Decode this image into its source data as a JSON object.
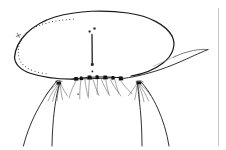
{
  "figure": {
    "title": "",
    "caption": "",
    "background_color": "#ffffff",
    "ink_color": "#1a1a1a",
    "width": 226,
    "height": 150,
    "style": "scientific line drawing, pen and ink"
  },
  "parts": {
    "body_outline": {
      "name": "body-outline",
      "description": "large oval dorsal shield outline"
    },
    "stipple_margin": {
      "name": "stippled-inner-margin",
      "description": "dotted inner line following the left and upper-left body margin",
      "dot_count": 34
    },
    "notch_mark": {
      "name": "lateral-notch-mark",
      "description": "small angular notch on upper-left margin"
    },
    "median_seta": {
      "name": "median-vertical-seta",
      "description": "vertical line on midline with a basal mark",
      "top_dots": 2
    },
    "ventral_tubercle_row": {
      "name": "ventral-setal-tubercle-row",
      "description": "row of dark setal bases along the lower body margin",
      "tubercle_count": 7
    },
    "ventral_setae": {
      "name": "ventral-setae-fan",
      "description": "fine curved setae descending from the tubercle row",
      "seta_count": 11
    },
    "lateral_appendage": {
      "name": "lateral-appendage",
      "description": "tapering appendage extending to the right and crossing the body margin"
    },
    "left_leg": {
      "name": "left-leg",
      "description": "left lateral leg with fine internal hairs"
    },
    "right_leg": {
      "name": "right-leg",
      "description": "right lateral leg with fine internal hairs"
    },
    "left_leg_hairs": {
      "name": "left-leg-hairs",
      "hair_count": 6
    },
    "right_leg_hairs": {
      "name": "right-leg-hairs",
      "hair_count": 6
    },
    "right_edge_rule": {
      "name": "plate-edge-rule",
      "description": "faint vertical rule near the right edge of the plate"
    }
  },
  "labels": {
    "items": []
  }
}
